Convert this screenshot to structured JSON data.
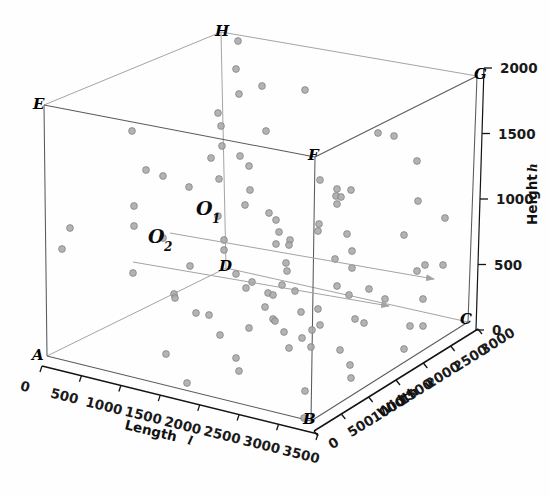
{
  "figure": {
    "type": "3d-scatter",
    "background_color": "#ffffff",
    "point_color": "#a8a8a8",
    "point_edge_color": "#7d7d7d",
    "edge_color_front": "#5a5a5a",
    "edge_color_back": "#9a9a9a"
  },
  "axes": {
    "x": {
      "title": "Length",
      "symbol": "l",
      "ticks": [
        "0",
        "500",
        "1000",
        "1500",
        "2000",
        "2500",
        "3000",
        "3500"
      ],
      "values": [
        0,
        500,
        1000,
        1500,
        2000,
        2500,
        3000,
        3500
      ],
      "range": [
        0,
        3800
      ]
    },
    "y": {
      "title": "Width",
      "symbol": "w",
      "ticks": [
        "0",
        "500",
        "1000",
        "1500",
        "2000",
        "2500",
        "3000"
      ],
      "values": [
        0,
        500,
        1000,
        1500,
        2000,
        2500,
        3000
      ],
      "range": [
        0,
        3200
      ]
    },
    "z": {
      "title": "Height",
      "symbol": "h",
      "ticks": [
        "0",
        "500",
        "1000",
        "1500",
        "2000"
      ],
      "values": [
        0,
        500,
        1000,
        1500,
        2000
      ],
      "range": [
        0,
        2400
      ]
    }
  },
  "vertices": [
    {
      "id": "A",
      "label": "A",
      "px": 47,
      "py": 356
    },
    {
      "id": "B",
      "label": "B",
      "px": 311,
      "py": 421
    },
    {
      "id": "C",
      "label": "C",
      "px": 468,
      "py": 322
    },
    {
      "id": "D",
      "label": "D",
      "px": 226,
      "py": 268
    },
    {
      "id": "E",
      "label": "E",
      "px": 44,
      "py": 105
    },
    {
      "id": "F",
      "label": "F",
      "px": 315,
      "py": 157
    },
    {
      "id": "G",
      "label": "G",
      "px": 477,
      "py": 76
    },
    {
      "id": "H",
      "label": "H",
      "px": 221,
      "py": 32
    }
  ],
  "annotations": [
    {
      "id": "O1",
      "label": "O",
      "subscript": "1",
      "label_x": 196,
      "label_y": 215,
      "line_start_x": 170,
      "line_start_y": 233,
      "line_end_x": 434,
      "line_end_y": 279
    },
    {
      "id": "O2",
      "label": "O",
      "subscript": "2",
      "label_x": 155,
      "label_y": 243,
      "line_start_x": 133,
      "line_start_y": 262,
      "line_end_x": 389,
      "line_end_y": 306
    }
  ],
  "chart_data": {
    "type": "scatter",
    "title": "",
    "xlabel": "Length l",
    "ylabel": "Width w",
    "zlabel": "Height h",
    "xlim": [
      0,
      3800
    ],
    "ylim": [
      0,
      3200
    ],
    "zlim": [
      0,
      2400
    ],
    "grid": false,
    "legend": "none",
    "n_points": 101,
    "points_px": [
      [
        238,
        41
      ],
      [
        236,
        69
      ],
      [
        218,
        113
      ],
      [
        239,
        94
      ],
      [
        262,
        86
      ],
      [
        266,
        131
      ],
      [
        221,
        126
      ],
      [
        222,
        146
      ],
      [
        305,
        90
      ],
      [
        132,
        131
      ],
      [
        211,
        158
      ],
      [
        240,
        156
      ],
      [
        146,
        170
      ],
      [
        163,
        176
      ],
      [
        189,
        187
      ],
      [
        219,
        179
      ],
      [
        249,
        166
      ],
      [
        250,
        190
      ],
      [
        134,
        206
      ],
      [
        245,
        205
      ],
      [
        378,
        133
      ],
      [
        394,
        136
      ],
      [
        320,
        180
      ],
      [
        337,
        189
      ],
      [
        417,
        161
      ],
      [
        336,
        196
      ],
      [
        337,
        204
      ],
      [
        70,
        228
      ],
      [
        62,
        249
      ],
      [
        134,
        226
      ],
      [
        218,
        216
      ],
      [
        276,
        220
      ],
      [
        279,
        232
      ],
      [
        351,
        190
      ],
      [
        341,
        197
      ],
      [
        404,
        235
      ],
      [
        425,
        265
      ],
      [
        269,
        213
      ],
      [
        276,
        244
      ],
      [
        290,
        240
      ],
      [
        319,
        224
      ],
      [
        347,
        234
      ],
      [
        352,
        251
      ],
      [
        190,
        266
      ],
      [
        224,
        240
      ],
      [
        224,
        250
      ],
      [
        133,
        273
      ],
      [
        174,
        294
      ],
      [
        236,
        274
      ],
      [
        252,
        282
      ],
      [
        289,
        245
      ],
      [
        286,
        263
      ],
      [
        287,
        271
      ],
      [
        318,
        231
      ],
      [
        335,
        259
      ],
      [
        352,
        268
      ],
      [
        417,
        271
      ],
      [
        175,
        298
      ],
      [
        196,
        313
      ],
      [
        209,
        315
      ],
      [
        246,
        288
      ],
      [
        268,
        293
      ],
      [
        273,
        295
      ],
      [
        282,
        285
      ],
      [
        295,
        291
      ],
      [
        337,
        286
      ],
      [
        349,
        295
      ],
      [
        369,
        289
      ],
      [
        265,
        307
      ],
      [
        273,
        319
      ],
      [
        301,
        312
      ],
      [
        318,
        309
      ],
      [
        320,
        325
      ],
      [
        355,
        319
      ],
      [
        220,
        335
      ],
      [
        249,
        328
      ],
      [
        275,
        321
      ],
      [
        284,
        332
      ],
      [
        302,
        338
      ],
      [
        312,
        330
      ],
      [
        364,
        323
      ],
      [
        410,
        326
      ],
      [
        423,
        326
      ],
      [
        166,
        354
      ],
      [
        236,
        358
      ],
      [
        239,
        371
      ],
      [
        289,
        348
      ],
      [
        311,
        347
      ],
      [
        340,
        350
      ],
      [
        404,
        349
      ],
      [
        187,
        383
      ],
      [
        350,
        365
      ],
      [
        351,
        378
      ],
      [
        305,
        391
      ],
      [
        423,
        299
      ],
      [
        385,
        299
      ],
      [
        443,
        265
      ],
      [
        445,
        218
      ],
      [
        418,
        201
      ],
      [
        163,
        238
      ],
      [
        304,
        418
      ]
    ]
  }
}
